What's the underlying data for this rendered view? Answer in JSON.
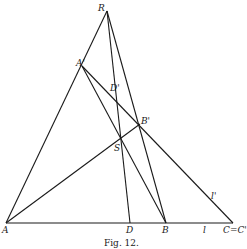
{
  "figure": {
    "caption": "Fig. 12.",
    "points": {
      "R": {
        "label": "R",
        "x": 107,
        "y": 11
      },
      "A1": {
        "label": "A'",
        "x": 82,
        "y": 66
      },
      "D1": {
        "label": "D'",
        "x": 117,
        "y": 100
      },
      "B1": {
        "label": "B'",
        "x": 140,
        "y": 124
      },
      "S": {
        "label": "S",
        "x": 121,
        "y": 140
      },
      "A": {
        "label": "A",
        "x": 6,
        "y": 223
      },
      "D": {
        "label": "D",
        "x": 130,
        "y": 223
      },
      "B": {
        "label": "B",
        "x": 166,
        "y": 223
      },
      "C": {
        "label": "C=C'",
        "x": 232,
        "y": 223
      }
    },
    "line_labels": {
      "l": "l",
      "l_prime": "l'"
    }
  }
}
